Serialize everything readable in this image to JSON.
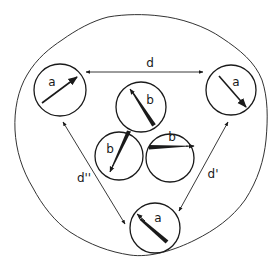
{
  "diagram": {
    "colors": {
      "stroke": "#1a1a1a",
      "background": "#ffffff"
    },
    "outer_region": {
      "shape": "irregular-blob"
    },
    "outer_circles": [
      {
        "id": "left",
        "label": "a",
        "cx": 60,
        "cy": 90,
        "r": 26
      },
      {
        "id": "right",
        "label": "a",
        "cx": 231,
        "cy": 90,
        "r": 25
      },
      {
        "id": "bottom",
        "label": "a",
        "cx": 155,
        "cy": 228,
        "r": 25
      }
    ],
    "inner_circles": [
      {
        "id": "top",
        "label": "b",
        "cx": 141,
        "cy": 107,
        "r": 25
      },
      {
        "id": "bottom-left",
        "label": "b",
        "cx": 119,
        "cy": 156,
        "r": 24
      },
      {
        "id": "bottom-right",
        "label": "b",
        "cx": 170,
        "cy": 158,
        "r": 24
      }
    ],
    "distances": [
      {
        "id": "d",
        "label": "d",
        "from": "left",
        "to": "right"
      },
      {
        "id": "d1",
        "label": "d'",
        "from": "right",
        "to": "bottom"
      },
      {
        "id": "d2",
        "label": "d''",
        "from": "left",
        "to": "bottom"
      }
    ]
  }
}
